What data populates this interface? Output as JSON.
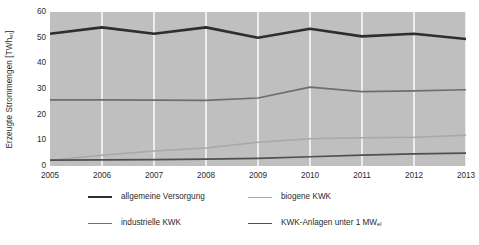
{
  "chart_data": {
    "type": "line",
    "title": "",
    "subtitle": "",
    "xlabel": "",
    "ylabel": "Erzeugte Strommengen [TWh",
    "ylabel_sub": "el",
    "ylabel_suffix": "]",
    "x": [
      2005,
      2006,
      2007,
      2008,
      2009,
      2010,
      2011,
      2012,
      2013
    ],
    "categories": [
      "2005",
      "2006",
      "2007",
      "2008",
      "2009",
      "2010",
      "2011",
      "2012",
      "2013"
    ],
    "xlim": [
      2005,
      2013
    ],
    "ylim": [
      0,
      60
    ],
    "yticks": [
      0,
      10,
      20,
      30,
      40,
      50,
      60
    ],
    "ytick_labels": [
      "0",
      "10",
      "20",
      "30",
      "40",
      "50",
      "60"
    ],
    "grid": "vertical-white-gridlines",
    "plot_background": "#bfbfbf",
    "figure_background": "#ffffff",
    "legend_position": "below-plot-two-columns",
    "series": [
      {
        "name": "allgemeine Versorgung",
        "color": "#2e2e2e",
        "width": 2.6,
        "values": [
          51.5,
          54.0,
          51.5,
          54.0,
          50.0,
          53.5,
          50.5,
          51.5,
          49.5
        ]
      },
      {
        "name": "industrielle KWK",
        "color": "#6e6e6e",
        "width": 1.7,
        "values": [
          25.8,
          25.8,
          25.7,
          25.6,
          26.5,
          30.7,
          29.0,
          29.3,
          29.7
        ]
      },
      {
        "name": "biogene KWK",
        "color": "#a8a8a8",
        "width": 1.5,
        "values": [
          2.2,
          4.2,
          5.8,
          7.0,
          9.3,
          10.6,
          11.0,
          11.2,
          12.0
        ]
      },
      {
        "name": "KWK-Anlagen unter 1 MW",
        "name_sub": "el",
        "color": "#4f4f4f",
        "width": 1.7,
        "values": [
          2.3,
          2.4,
          2.5,
          2.7,
          3.0,
          3.6,
          4.2,
          4.7,
          5.0
        ]
      }
    ]
  },
  "legend": {
    "items": [
      {
        "label": "allgemeine Versorgung",
        "sub": "",
        "color": "#2e2e2e",
        "width": 2.6
      },
      {
        "label": "biogene KWK",
        "sub": "",
        "color": "#a8a8a8",
        "width": 1.5
      },
      {
        "label": "industrielle KWK",
        "sub": "",
        "color": "#6e6e6e",
        "width": 1.7
      },
      {
        "label": "KWK-Anlagen unter 1 MW",
        "sub": "el",
        "color": "#4f4f4f",
        "width": 1.7
      }
    ]
  }
}
